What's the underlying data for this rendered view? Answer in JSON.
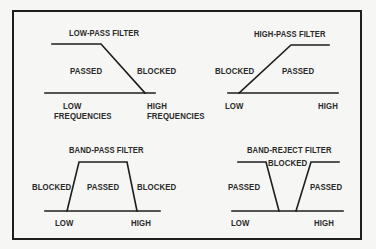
{
  "diagrams": {
    "low_pass": {
      "title": "LOW-PASS FILTER",
      "passed": "PASSED",
      "blocked": "BLOCKED",
      "low_line1": "LOW",
      "low_line2": "FREQUENCIES",
      "high_line1": "HIGH",
      "high_line2": "FREQUENCIES"
    },
    "high_pass": {
      "title": "HIGH-PASS FILTER",
      "blocked": "BLOCKED",
      "passed": "PASSED",
      "low": "LOW",
      "high": "HIGH"
    },
    "band_pass": {
      "title": "BAND-PASS FILTER",
      "blocked_left": "BLOCKED",
      "passed": "PASSED",
      "blocked_right": "BLOCKED",
      "low": "LOW",
      "high": "HIGH"
    },
    "band_reject": {
      "title": "BAND-REJECT FILTER",
      "passed_left": "PASSED",
      "blocked": "BLOCKED",
      "passed_right": "PASSED",
      "low": "LOW",
      "high": "HIGH"
    }
  },
  "colors": {
    "line": "#1e1e1e",
    "text": "#2a2a2a",
    "background": "#f6f6f4"
  }
}
